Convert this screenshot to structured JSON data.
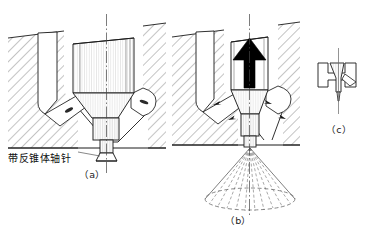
{
  "figure": {
    "background_color": "#ffffff",
    "line_color": "#1a1a1a",
    "hatch_color": "#555555",
    "spray_color": "#7a7a7a",
    "arrow_color": "#000000"
  },
  "annotations": {
    "pintle_label": "带反锥体轴针"
  },
  "subfigures": [
    {
      "id": "a",
      "caption": "（a）",
      "description_role": "closed-seated-nozzle"
    },
    {
      "id": "b",
      "caption": "（b）",
      "description_role": "lifted-nozzle-with-spray-cone"
    },
    {
      "id": "c",
      "caption": "（c）",
      "description_role": "pintle-tip-detail"
    }
  ]
}
